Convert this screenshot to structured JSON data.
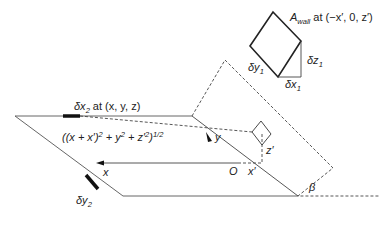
{
  "figure": {
    "labels": {
      "a_wall_symbol": "A",
      "a_wall_sub": "wall",
      "a_wall_rest": " at (−x′, 0, z′)",
      "dy1": "δy",
      "dy1_sub": "1",
      "dz1": "δz",
      "dz1_sub": "1",
      "dx1": "δx",
      "dx1_sub": "1",
      "dx2": "δx",
      "dx2_sub": "2",
      "dx2_rest": " at (x, y, z)",
      "distance_expr_a": "((x + x′)",
      "distance_expr_sq1": "2",
      "distance_expr_b": " + y",
      "distance_expr_sq2": "2",
      "distance_expr_c": " + z′",
      "distance_expr_sq3": "2",
      "distance_expr_d": ")",
      "distance_expr_pow": "1/2",
      "y_axis": "y",
      "x_axis": "x",
      "origin": "O",
      "x_prime": "x′",
      "z_prime": "z′",
      "dy2": "δy",
      "dy2_sub": "2",
      "beta": "β"
    },
    "colors": {
      "line": "#333333",
      "thick": "#111111",
      "dashed": "#444444"
    }
  }
}
